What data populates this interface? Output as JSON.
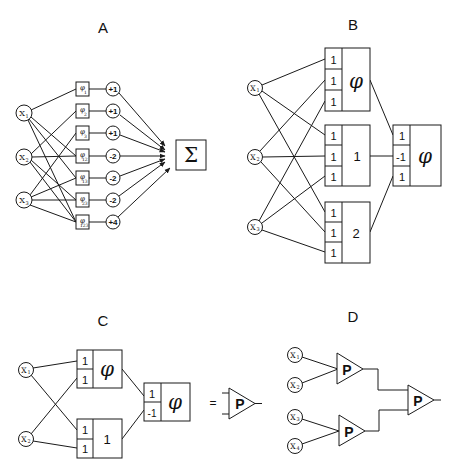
{
  "panels": {
    "A": {
      "label": "A",
      "inputs": [
        "x1",
        "x2",
        "x3"
      ],
      "input_display": [
        "X",
        "X",
        "X"
      ],
      "input_subs": [
        "1",
        "2",
        "3"
      ],
      "phi_units": [
        {
          "symbol": "φ",
          "sub": "1",
          "weight": "+1"
        },
        {
          "symbol": "φ",
          "sub": "2",
          "weight": "+1"
        },
        {
          "symbol": "φ",
          "sub": "3",
          "weight": "+1"
        },
        {
          "symbol": "φ",
          "sub": "12",
          "weight": "-2"
        },
        {
          "symbol": "φ",
          "sub": "13",
          "weight": "-2"
        },
        {
          "symbol": "φ",
          "sub": "23",
          "weight": "-2"
        },
        {
          "symbol": "φ",
          "sub": "123",
          "weight": "+4"
        }
      ],
      "output_symbol": "Σ"
    },
    "B": {
      "label": "B",
      "inputs": [
        "x1",
        "x2",
        "x3"
      ],
      "input_display": [
        "X",
        "X",
        "X"
      ],
      "input_subs": [
        "1",
        "2",
        "3"
      ],
      "hidden_units": [
        {
          "weights": [
            "1",
            "1",
            "1"
          ],
          "threshold": "φ"
        },
        {
          "weights": [
            "1",
            "1",
            "1"
          ],
          "threshold": "1"
        },
        {
          "weights": [
            "1",
            "1",
            "1"
          ],
          "threshold": "2"
        }
      ],
      "output_unit": {
        "weights": [
          "1",
          "-1",
          "1"
        ],
        "threshold": "φ"
      }
    },
    "C": {
      "label": "C",
      "inputs": [
        "x1",
        "x2"
      ],
      "input_display": [
        "X",
        "X"
      ],
      "input_subs": [
        "1",
        "2"
      ],
      "hidden_units": [
        {
          "weights": [
            "1",
            "1"
          ],
          "threshold": "φ"
        },
        {
          "weights": [
            "1",
            "1"
          ],
          "threshold": "1"
        }
      ],
      "output_unit": {
        "weights": [
          "1",
          "-1"
        ],
        "threshold": "φ"
      },
      "equals": "=",
      "parity_symbol": "P"
    },
    "D": {
      "label": "D",
      "inputs": [
        "x1",
        "x2",
        "x3",
        "x4"
      ],
      "input_display": [
        "X",
        "X",
        "X",
        "X"
      ],
      "input_subs": [
        "1",
        "2",
        "3",
        "4"
      ],
      "parity_symbol": "P"
    }
  }
}
